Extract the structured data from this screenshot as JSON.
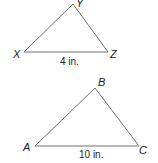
{
  "diagram": {
    "triangles": [
      {
        "name": "XYZ",
        "vertices": {
          "X": [
            24,
            52
          ],
          "Y": [
            73,
            4
          ],
          "Z": [
            108,
            52
          ]
        },
        "labels": {
          "X": "X",
          "Y": "Y",
          "Z": "Z"
        },
        "base_measure": "4 in."
      },
      {
        "name": "ABC",
        "vertices": {
          "A": [
            35,
            146
          ],
          "B": [
            95,
            88
          ],
          "C": [
            139,
            146
          ]
        },
        "labels": {
          "A": "A",
          "B": "B",
          "C": "C"
        },
        "base_measure": "10 in."
      }
    ],
    "stroke_color": "#6e6e6e"
  }
}
